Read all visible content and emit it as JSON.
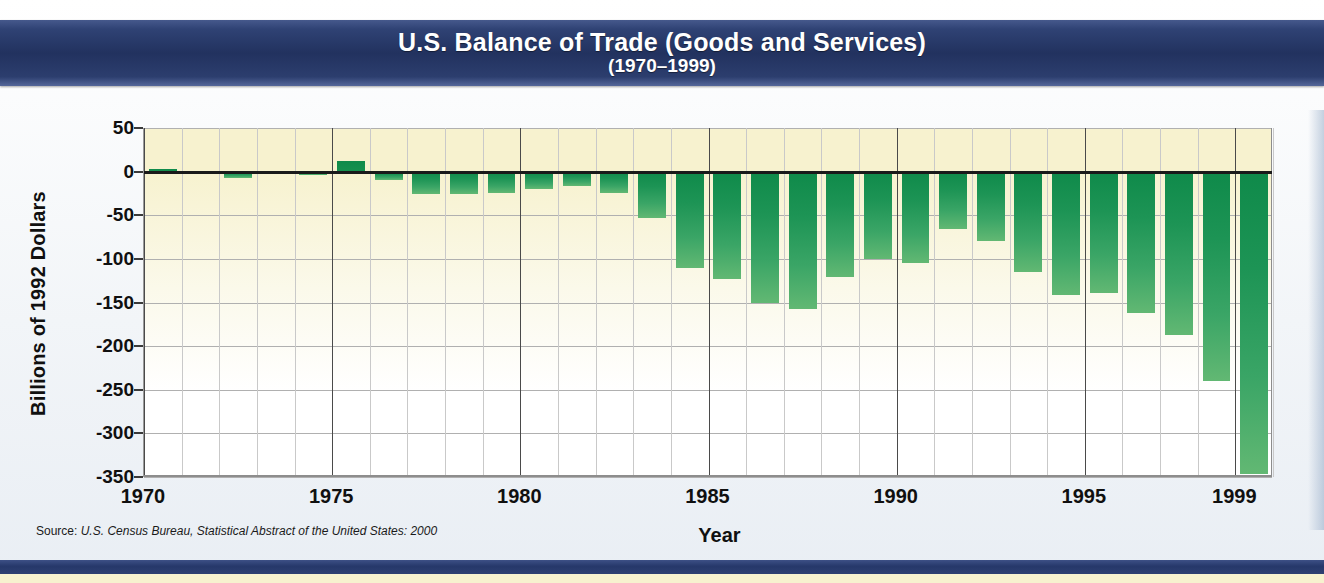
{
  "title": {
    "main": "U.S. Balance of Trade (Goods and Services)",
    "sub": "(1970–1999)"
  },
  "source": {
    "lead": "Source: ",
    "body": "U.S. Census Bureau, Statistical Abstract of the United States: 2000"
  },
  "colors": {
    "banner_blue": "#22325f",
    "bar_green": "#1d9455",
    "bar_green_light": "#62b873",
    "plot_cream": "#f7f2cf",
    "grid": "#b0b0b0",
    "zero_line": "#1a1a1a",
    "text": "#101010"
  },
  "chart_data": {
    "type": "bar",
    "title": "U.S. Balance of Trade (Goods and Services) (1970–1999)",
    "xlabel": "Year",
    "ylabel": "Billions of 1992 Dollars",
    "ylim": [
      -350,
      50
    ],
    "xlim": [
      1969.5,
      1999.5
    ],
    "yticks": [
      50,
      0,
      -50,
      -100,
      -150,
      -200,
      -250,
      -300,
      -350
    ],
    "ytick_labels": [
      "50",
      "0",
      "-50",
      "-100",
      "-150",
      "-200",
      "-250",
      "-300",
      "-350"
    ],
    "xticks": [
      1970,
      1975,
      1980,
      1985,
      1990,
      1995,
      1999
    ],
    "xtick_labels": [
      "1970",
      "1975",
      "1980",
      "1985",
      "1990",
      "1995",
      "1999"
    ],
    "grid": true,
    "legend": null,
    "categories": [
      1970,
      1971,
      1972,
      1973,
      1974,
      1975,
      1976,
      1977,
      1978,
      1979,
      1980,
      1981,
      1982,
      1983,
      1984,
      1985,
      1986,
      1987,
      1988,
      1989,
      1990,
      1991,
      1992,
      1993,
      1994,
      1995,
      1996,
      1997,
      1998,
      1999
    ],
    "values": [
      3,
      0,
      -7,
      -2,
      -4,
      12,
      -10,
      -26,
      -26,
      -25,
      -20,
      -17,
      -25,
      -53,
      -110,
      -123,
      -150,
      -158,
      -121,
      -100,
      -105,
      -66,
      -80,
      -115,
      -141,
      -139,
      -162,
      -187,
      -240,
      -347
    ],
    "units": "billions of 1992 dollars"
  }
}
